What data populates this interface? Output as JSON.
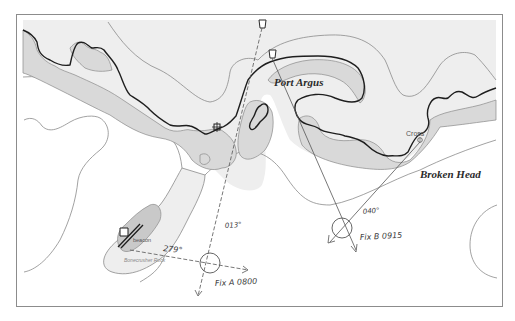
{
  "diagram": {
    "type": "nautical-chart-position-fix",
    "colors": {
      "frame": "#8c8c8c",
      "sea_shallow": "#eeeeee",
      "land": "#ffffff",
      "drying_area": "#d9d9d9",
      "coastline": "#1e1e1e",
      "depth_contour": "#8a8a8a",
      "bearing_line": "#555555"
    },
    "places": {
      "port": "Port Argus",
      "headland": "Broken Head",
      "cross": "Cross",
      "beacon": "beacon",
      "rock": "Bonecrusher Rock"
    },
    "landmarks": [
      {
        "name": "lighthouse-upper",
        "symbol": "light-tower-icon"
      },
      {
        "name": "lighthouse-lower",
        "symbol": "light-tower-icon"
      },
      {
        "name": "cross",
        "symbol": "cross-icon"
      },
      {
        "name": "beacon",
        "symbol": "beacon-icon"
      },
      {
        "name": "square-marker",
        "symbol": "square-marker-icon"
      }
    ],
    "bearings": [
      {
        "label": "013°",
        "from": "lighthouse-upper",
        "to": "Fix A"
      },
      {
        "label": "279°",
        "from": "beacon",
        "to": "Fix A"
      },
      {
        "label": "040°",
        "from": "Cross",
        "to": "Fix B"
      }
    ],
    "fixes": [
      {
        "label": "Fix A 0800",
        "name": "Fix A",
        "time": "0800"
      },
      {
        "label": "Fix B 0915",
        "name": "Fix B",
        "time": "0915"
      }
    ]
  }
}
